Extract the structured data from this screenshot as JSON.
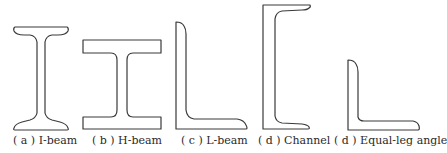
{
  "figure": {
    "stroke_color": "#3a3a3a",
    "background": "#ffffff",
    "panels": [
      {
        "id": "a",
        "label": "( a )  I-beam",
        "shape": "I-beam"
      },
      {
        "id": "b",
        "label": "( b )  H-beam",
        "shape": "H-beam"
      },
      {
        "id": "c",
        "label": "( c )  L-beam",
        "shape": "L-beam"
      },
      {
        "id": "d",
        "label": "( d )  Channel",
        "shape": "Channel"
      },
      {
        "id": "d2",
        "label": "( d )  Equal-leg angle",
        "shape": "Equal-leg angle"
      }
    ]
  }
}
